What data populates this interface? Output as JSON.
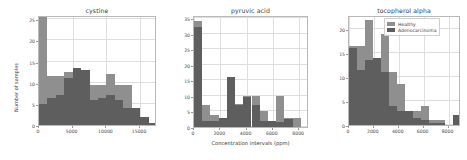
{
  "figure": {
    "shared_ylabel": "Number of samples",
    "shared_xlabel": "Concentration intervals  (ppm)",
    "legend": {
      "series": [
        {
          "name": "Healthy",
          "color": "#8f8f8f"
        },
        {
          "name": "Adenocarcinoma",
          "color": "#5e5e5e"
        }
      ]
    }
  },
  "chart_data": [
    {
      "type": "bar",
      "title": "cystine",
      "xlabel": "",
      "ylabel": "Number of samples",
      "xlim": [
        0,
        17500
      ],
      "ylim": [
        0,
        26
      ],
      "xticks": [
        0,
        5000,
        10000,
        15000
      ],
      "xticklabels": [
        "0",
        "5000",
        "10000",
        "15000"
      ],
      "yticks": [
        0,
        5,
        10,
        15,
        20,
        25
      ],
      "yticklabels": [
        "0",
        "5",
        "10",
        "15",
        "20",
        "25"
      ],
      "grid": true,
      "bin_edges": [
        0,
        1250,
        2500,
        3750,
        5000,
        6250,
        7500,
        8750,
        10000,
        11250,
        12500,
        13750,
        15000,
        16250,
        17500
      ],
      "series": [
        {
          "name": "Healthy",
          "color": "#8f8f8f",
          "values": [
            25.5,
            11.5,
            11.5,
            12.5,
            13.5,
            13.0,
            9.5,
            9.5,
            12.0,
            9.5,
            9.5,
            4.0,
            2.0,
            0.5
          ]
        },
        {
          "name": "Adenocarcinoma",
          "color": "#5e5e5e",
          "values": [
            5.0,
            6.5,
            7.0,
            11.0,
            13.5,
            13.0,
            6.0,
            6.5,
            7.0,
            6.0,
            4.0,
            4.0,
            2.0,
            0.5
          ]
        }
      ]
    },
    {
      "type": "bar",
      "title": "pyruvic acid",
      "xlabel": "Concentration intervals  (ppm)",
      "ylabel": "",
      "xlim": [
        0,
        8750
      ],
      "ylim": [
        0,
        36
      ],
      "xticks": [
        0,
        2000,
        4000,
        6000,
        8000
      ],
      "xticklabels": [
        "0",
        "2000",
        "4000",
        "6000",
        "8000"
      ],
      "yticks": [
        0,
        5,
        10,
        15,
        20,
        25,
        30,
        35
      ],
      "yticklabels": [
        "0",
        "5",
        "10",
        "15",
        "20",
        "25",
        "30",
        "35"
      ],
      "grid": true,
      "bin_edges": [
        0,
        625,
        1250,
        1875,
        2500,
        3125,
        3750,
        4375,
        5000,
        5625,
        6250,
        6875,
        7500,
        8125,
        8750
      ],
      "series": [
        {
          "name": "Healthy",
          "color": "#8f8f8f",
          "values": [
            34.0,
            7.0,
            4.0,
            3.0,
            16.0,
            7.5,
            10.0,
            10.0,
            5.0,
            2.0,
            10.0,
            3.0,
            3.0,
            0.0
          ]
        },
        {
          "name": "Adenocarcinoma",
          "color": "#5e5e5e",
          "values": [
            32.0,
            2.0,
            2.0,
            3.0,
            16.0,
            7.0,
            9.5,
            7.0,
            2.0,
            2.0,
            1.5,
            2.5,
            0.0,
            0.0
          ]
        }
      ]
    },
    {
      "type": "bar",
      "title": "tocopherol alpha",
      "xlabel": "",
      "ylabel": "",
      "xlim": [
        0,
        9000
      ],
      "ylim": [
        0,
        23
      ],
      "xticks": [
        0,
        2000,
        4000,
        6000,
        8000
      ],
      "xticklabels": [
        "0",
        "2000",
        "4000",
        "6000",
        "8000"
      ],
      "yticks": [
        0,
        5,
        10,
        15,
        20
      ],
      "yticklabels": [
        "0",
        "5",
        "10",
        "15",
        "20"
      ],
      "grid": true,
      "bin_edges": [
        0,
        643,
        1286,
        1929,
        2571,
        3214,
        3857,
        4500,
        5143,
        5786,
        6429,
        7071,
        7714,
        8357,
        9000
      ],
      "series": [
        {
          "name": "Healthy",
          "color": "#8f8f8f",
          "values": [
            16.5,
            16.5,
            22.0,
            14.0,
            19.0,
            11.0,
            8.5,
            3.0,
            3.0,
            4.0,
            1.0,
            1.0,
            0.0,
            2.0
          ]
        },
        {
          "name": "Adenocarcinoma",
          "color": "#5e5e5e",
          "values": [
            16.0,
            11.5,
            13.5,
            14.0,
            11.0,
            4.0,
            3.0,
            3.0,
            1.5,
            1.0,
            0.5,
            0.5,
            0.0,
            2.0
          ]
        }
      ]
    }
  ]
}
